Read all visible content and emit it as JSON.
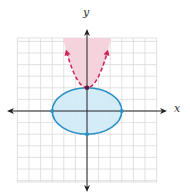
{
  "chart_data": {
    "type": "line",
    "title": "",
    "xlabel": "x",
    "ylabel": "y",
    "xlim": [
      -6,
      6
    ],
    "ylim": [
      -6,
      6.3
    ],
    "grid": true,
    "legend": null,
    "tick_labels": [],
    "series": [
      {
        "name": "ellipse",
        "kind": "ellipse",
        "equation": "x^2/9 + y^2/4 <= 1",
        "center": [
          0,
          0
        ],
        "rx": 3,
        "ry": 2,
        "boundary": "solid",
        "shaded": "inside",
        "stroke_color": "#2a8fc4",
        "fill_color": "#cfeaf7",
        "marked_points": [
          [
            -3,
            0
          ],
          [
            3,
            0
          ],
          [
            0,
            2
          ],
          [
            0,
            -2
          ]
        ]
      },
      {
        "name": "parabola",
        "kind": "parabola",
        "equation": "y > x^2 + 2",
        "vertex": [
          0,
          2
        ],
        "a": 1,
        "boundary": "dashed",
        "shaded": "above",
        "stroke_color": "#d0245a",
        "fill_color": "#f5d3dc",
        "marked_points": [
          [
            0,
            2
          ]
        ],
        "x": [
          -2,
          -1.5,
          -1,
          -0.5,
          0,
          0.5,
          1,
          1.5,
          2
        ],
        "y": [
          6,
          4.25,
          3,
          2.25,
          2,
          2.25,
          3,
          4.25,
          6
        ]
      }
    ]
  },
  "labels": {
    "x_axis": "x",
    "y_axis": "y"
  },
  "colors": {
    "grid": "#d9d9d9",
    "axis": "#222222",
    "ellipse_stroke": "#2a8fc4",
    "ellipse_fill": "#cfeaf7",
    "parabola_stroke": "#d0245a",
    "parabola_fill": "#f5d3dc"
  }
}
